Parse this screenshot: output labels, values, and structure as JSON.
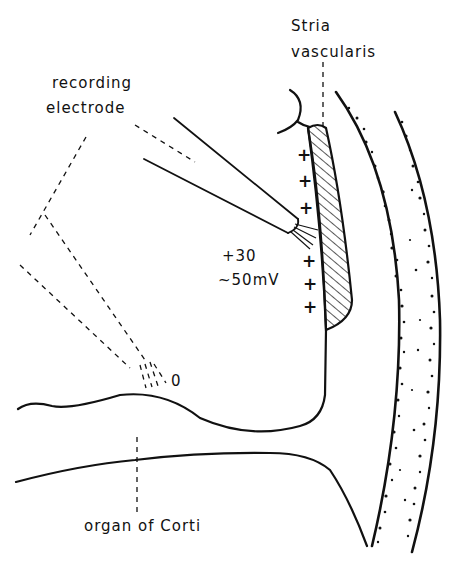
{
  "figure": {
    "type": "anatomical cross-section diagram (cochlear duct)",
    "labels": {
      "stria_line1": "Stria",
      "stria_line2": "vascularis",
      "electrode_line1": "recording",
      "electrode_line2": "electrode",
      "potential_line1": "+30",
      "potential_line2": "~50mV",
      "zero_potential": "0",
      "organ": "organ of Corti"
    },
    "plus_sign": "+",
    "plus_count": 6,
    "colors": {
      "ink": "#111111",
      "background": "#ffffff"
    }
  }
}
